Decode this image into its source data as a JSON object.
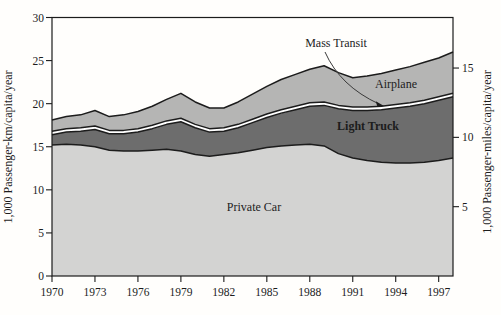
{
  "figure": {
    "background": "#fffefc",
    "line_color": "#1c1c1c"
  },
  "chart_data": {
    "type": "area",
    "stacked": true,
    "title": "",
    "ylabel_left": "1,000 Passenger-km/capita/year",
    "ylabel_right": "1,000 Passenger-miles/capita/year",
    "xlim": [
      1970,
      1998
    ],
    "ylim_left": [
      0,
      30
    ],
    "km_per_mile": 1.609,
    "grid": false,
    "legend_position": "in-plot-labels",
    "x_ticks": [
      1970,
      1973,
      1976,
      1979,
      1982,
      1985,
      1988,
      1991,
      1994,
      1997
    ],
    "y_left_ticks": [
      0,
      5,
      10,
      15,
      20,
      25,
      30
    ],
    "y_right_ticks": [
      5,
      10,
      15
    ],
    "x": [
      1970,
      1971,
      1972,
      1973,
      1974,
      1975,
      1976,
      1977,
      1978,
      1979,
      1980,
      1981,
      1982,
      1983,
      1984,
      1985,
      1986,
      1987,
      1988,
      1989,
      1990,
      1991,
      1992,
      1993,
      1994,
      1995,
      1996,
      1997,
      1998
    ],
    "series": [
      {
        "name": "Private Car",
        "color": "#d3d3d2",
        "values": [
          15.2,
          15.3,
          15.2,
          15.0,
          14.6,
          14.5,
          14.5,
          14.6,
          14.7,
          14.5,
          14.1,
          13.9,
          14.1,
          14.3,
          14.6,
          14.9,
          15.1,
          15.2,
          15.3,
          15.1,
          14.2,
          13.7,
          13.4,
          13.2,
          13.1,
          13.1,
          13.2,
          13.4,
          13.7
        ]
      },
      {
        "name": "Light Truck",
        "color": "#6d6d6d",
        "values": [
          1.2,
          1.4,
          1.6,
          2.0,
          1.9,
          2.0,
          2.2,
          2.5,
          2.9,
          3.4,
          3.1,
          2.8,
          2.7,
          2.9,
          3.2,
          3.5,
          3.8,
          4.1,
          4.4,
          4.7,
          5.2,
          5.5,
          5.8,
          6.1,
          6.4,
          6.6,
          6.8,
          7.0,
          7.1
        ]
      },
      {
        "name": "Mass Transit",
        "color": "#ffffff",
        "values": [
          0.4,
          0.4,
          0.4,
          0.4,
          0.4,
          0.4,
          0.4,
          0.4,
          0.4,
          0.4,
          0.4,
          0.4,
          0.4,
          0.4,
          0.4,
          0.4,
          0.4,
          0.4,
          0.4,
          0.4,
          0.4,
          0.4,
          0.4,
          0.4,
          0.4,
          0.4,
          0.4,
          0.4,
          0.4
        ]
      },
      {
        "name": "Airplane",
        "color": "#b5b5b4",
        "values": [
          1.3,
          1.4,
          1.5,
          1.8,
          1.6,
          1.8,
          2.0,
          2.2,
          2.5,
          2.9,
          2.6,
          2.4,
          2.3,
          2.6,
          2.9,
          3.2,
          3.5,
          3.7,
          3.9,
          4.2,
          3.8,
          3.4,
          3.6,
          3.8,
          4.0,
          4.2,
          4.4,
          4.5,
          4.8
        ]
      }
    ],
    "annotations": [
      {
        "text": "Mass Transit",
        "has_arrow": true
      },
      {
        "text": "Airplane",
        "has_arrow": false
      },
      {
        "text": "Light Truck",
        "has_arrow": false,
        "bold": true,
        "color": "#ececec"
      },
      {
        "text": "Private Car",
        "has_arrow": false
      }
    ]
  }
}
